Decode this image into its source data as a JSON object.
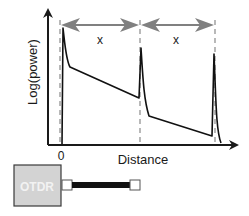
{
  "diagram": {
    "y_axis_label": "Log(power)",
    "x_axis_label": "Distance",
    "origin_label": "0",
    "span_labels": [
      "x",
      "x"
    ],
    "device_label": "OTDR",
    "colors": {
      "axis": "#1a1a1a",
      "trace": "#111111",
      "dashed": "#8a8a8a",
      "span_arrow": "#808080",
      "otdr_fill": "#d3d3d3",
      "otdr_text": "#f2f2f2",
      "fiber": "#111111"
    }
  }
}
